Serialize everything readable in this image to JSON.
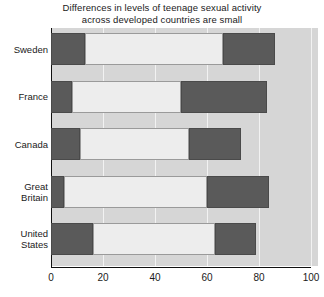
{
  "chart_data": {
    "type": "bar",
    "orientation": "horizontal",
    "stacked": true,
    "title": "Differences in levels of teenage sexual activity across developed countries are small",
    "title_line1": "Differences in levels of teenage sexual activity",
    "title_line2": "across developed countries are small",
    "xlabel": "",
    "ylabel": "",
    "xlim": [
      0,
      100
    ],
    "xticks": [
      0,
      20,
      40,
      60,
      80,
      100
    ],
    "xtick_labels": [
      "0",
      "20",
      "40",
      "60",
      "80",
      "100"
    ],
    "grid": true,
    "legend": "none",
    "categories": [
      "Sweden",
      "France",
      "Canada",
      "Great Britain",
      "United States"
    ],
    "category_label_lines": [
      [
        "Sweden"
      ],
      [
        "France"
      ],
      [
        "Canada"
      ],
      [
        "Great",
        "Britain"
      ],
      [
        "United",
        "States"
      ]
    ],
    "series": [
      {
        "name": "segment-1",
        "style": "dark",
        "values": [
          13,
          8,
          11,
          5,
          16
        ]
      },
      {
        "name": "segment-2",
        "style": "light",
        "values": [
          53,
          42,
          42,
          55,
          47
        ]
      },
      {
        "name": "segment-3",
        "style": "dark",
        "values": [
          20,
          33,
          20,
          24,
          16
        ]
      }
    ],
    "bars": [
      {
        "category": "Sweden",
        "segments": [
          {
            "start": 0,
            "end": 13,
            "style": "dark"
          },
          {
            "start": 13,
            "end": 66,
            "style": "light"
          },
          {
            "start": 66,
            "end": 86,
            "style": "dark"
          }
        ]
      },
      {
        "category": "France",
        "segments": [
          {
            "start": 0,
            "end": 8,
            "style": "dark"
          },
          {
            "start": 8,
            "end": 50,
            "style": "light"
          },
          {
            "start": 50,
            "end": 83,
            "style": "dark"
          }
        ]
      },
      {
        "category": "Canada",
        "segments": [
          {
            "start": 0,
            "end": 11,
            "style": "dark"
          },
          {
            "start": 11,
            "end": 53,
            "style": "light"
          },
          {
            "start": 53,
            "end": 73,
            "style": "dark"
          }
        ]
      },
      {
        "category": "Great Britain",
        "segments": [
          {
            "start": 0,
            "end": 5,
            "style": "dark"
          },
          {
            "start": 5,
            "end": 60,
            "style": "light"
          },
          {
            "start": 60,
            "end": 84,
            "style": "dark"
          }
        ]
      },
      {
        "category": "United States",
        "segments": [
          {
            "start": 0,
            "end": 16,
            "style": "dark"
          },
          {
            "start": 16,
            "end": 63,
            "style": "light"
          },
          {
            "start": 63,
            "end": 79,
            "style": "dark"
          }
        ]
      }
    ],
    "colors": {
      "dark_segment": "#5a5a5a",
      "light_segment": "#ededed",
      "plot_background": "#d6d6d6",
      "gridline": "#f2f2f2",
      "axis": "#111111",
      "text": "#1a1a1a"
    }
  }
}
